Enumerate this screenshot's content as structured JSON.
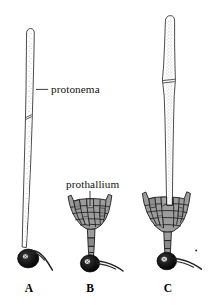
{
  "figure": {
    "background_color": "#ffffff",
    "ink_color": "#1a1a1a",
    "cell_fill_color": "#9c9c9c",
    "spore_color": "#141414",
    "annotations": [
      {
        "id": "protonema",
        "text": "protonema",
        "points_to": "filament of panel A",
        "leader": "horizontal-left"
      },
      {
        "id": "prothallium",
        "text": "prothallium",
        "points_to": "cell mass of panel B",
        "leader": "vertical-down"
      }
    ],
    "panels": [
      {
        "id": "A",
        "label": "A",
        "caption": "protonema filament with spore and rhizoid",
        "parts": [
          "protonema",
          "spore",
          "rhizoid"
        ]
      },
      {
        "id": "B",
        "label": "B",
        "caption": "prothallium cell plate with spore and rhizoid",
        "parts": [
          "prothallium",
          "spore",
          "rhizoid"
        ]
      },
      {
        "id": "C",
        "label": "C",
        "caption": "protonema with prothallium, spore and rhizoid",
        "parts": [
          "protonema",
          "prothallium",
          "spore",
          "rhizoid"
        ]
      }
    ]
  }
}
